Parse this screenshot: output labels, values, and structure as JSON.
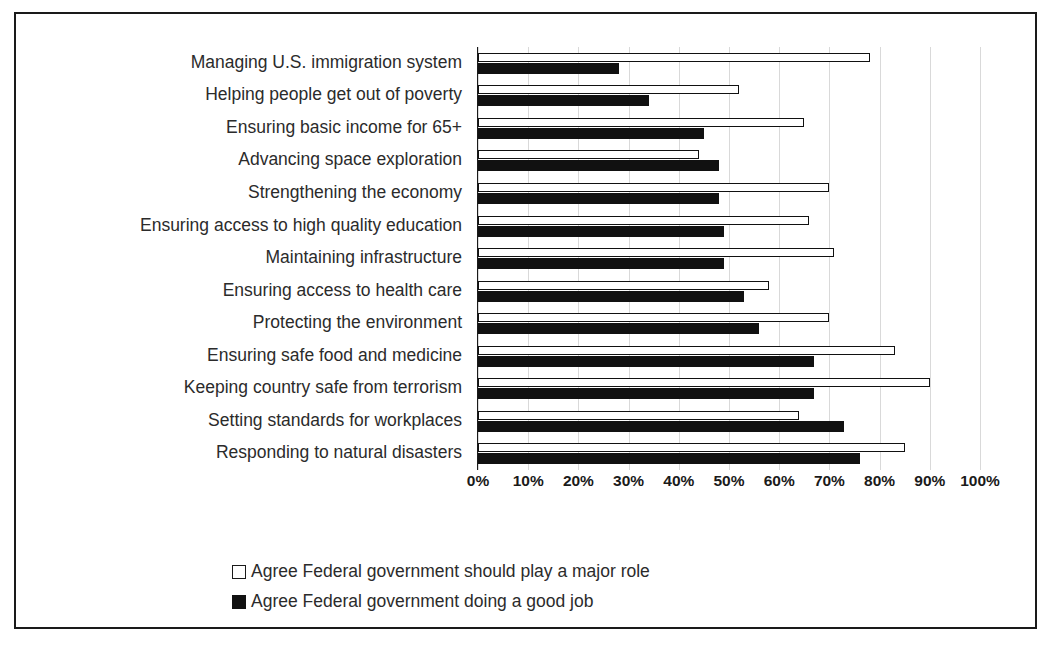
{
  "chart_data": {
    "type": "bar",
    "orientation": "horizontal",
    "title": "",
    "subtitle": "",
    "xlabel": "",
    "ylabel": "",
    "xlim": [
      0,
      100
    ],
    "xticks": [
      0,
      10,
      20,
      30,
      40,
      50,
      60,
      70,
      80,
      90,
      100
    ],
    "xtick_labels": [
      "0%",
      "10%",
      "20%",
      "30%",
      "40%",
      "50%",
      "60%",
      "70%",
      "80%",
      "90%",
      "100%"
    ],
    "grid": true,
    "grid_axis": "x",
    "legend_position": "bottom-center",
    "categories": [
      "Managing U.S. immigration system",
      "Helping people get out of poverty",
      "Ensuring basic income for 65+",
      "Advancing space exploration",
      "Strengthening the economy",
      "Ensuring access to high quality education",
      "Maintaining infrastructure",
      "Ensuring access to health care",
      "Protecting the environment",
      "Ensuring safe food and medicine",
      "Keeping country safe from terrorism",
      "Setting standards for workplaces",
      "Responding to natural disasters"
    ],
    "series": [
      {
        "name": "Agree Federal government should play a major role",
        "color": "#ffffff",
        "edge_color": "#111111",
        "values": [
          78,
          52,
          65,
          44,
          70,
          66,
          71,
          58,
          70,
          83,
          90,
          64,
          85
        ]
      },
      {
        "name": "Agree Federal government doing a good job",
        "color": "#111111",
        "edge_color": "#111111",
        "values": [
          28,
          34,
          45,
          48,
          48,
          49,
          49,
          53,
          56,
          67,
          67,
          73,
          76
        ]
      }
    ]
  },
  "legend": {
    "items": [
      {
        "label": "Agree Federal government should play a major role",
        "swatch": "hollow-square"
      },
      {
        "label": "Agree Federal government doing a good job",
        "swatch": "filled-square"
      }
    ]
  },
  "colors": {
    "frame": "#1a1a1a",
    "grid": "#d9d9d9",
    "bar_filled": "#111111",
    "bar_hollow": "#ffffff",
    "text": "#2b2b2b",
    "background": "#ffffff"
  }
}
